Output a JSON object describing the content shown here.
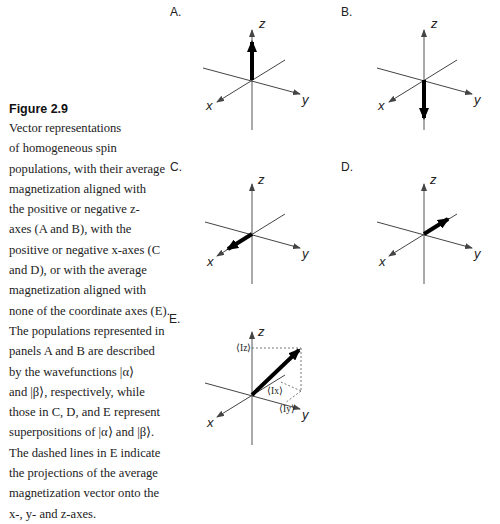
{
  "caption": {
    "figure_label": "Figure 2.9",
    "lines": [
      "Vector representations",
      "of homogeneous spin",
      "populations, with their average",
      "magnetization aligned with",
      "the positive or negative z-",
      "axes (A and B), with the",
      "positive or negative x-axes (C",
      "and D), or with the average",
      "magnetization aligned with",
      "none of the coordinate axes (E).",
      "The populations represented in",
      "panels A and B are described",
      "by the wavefunctions |α⟩",
      "and |β⟩, respectively, while",
      "those in C, D, and E represent",
      "superpositions of |α⟩ and |β⟩.",
      "The dashed lines in E indicate",
      "the projections of the average",
      "magnetization vector onto the",
      "x-, y- and z-axes."
    ]
  },
  "panels": [
    {
      "label": "A.",
      "description": "Magnetization along +z"
    },
    {
      "label": "B.",
      "description": "Magnetization along -z"
    },
    {
      "label": "C.",
      "description": "Magnetization along +x"
    },
    {
      "label": "D.",
      "description": "Magnetization along -x"
    },
    {
      "label": "E.",
      "description": "Magnetization along none of the axes with projections"
    }
  ],
  "axes": {
    "x": "x",
    "y": "y",
    "z": "z"
  },
  "projections": {
    "z": "⟨Iz⟩",
    "x": "⟨Ix⟩",
    "y": "⟨Iy⟩"
  },
  "colors": {
    "axis": "#444444",
    "vector": "#000000",
    "text": "#222222"
  }
}
